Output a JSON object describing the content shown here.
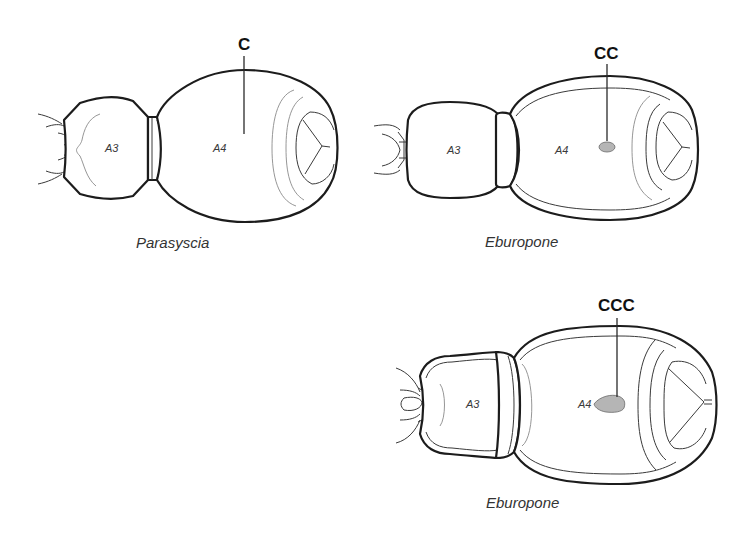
{
  "figures": [
    {
      "id": "parasyscia",
      "caption": "Parasyscia",
      "callout": "C",
      "segment_labels": {
        "a3": "A3",
        "a4": "A4"
      },
      "spot": "none"
    },
    {
      "id": "eburopone-1",
      "caption": "Eburopone",
      "callout": "CC",
      "segment_labels": {
        "a3": "A3",
        "a4": "A4"
      },
      "spot": "small oval",
      "spot_color": "#b5b5b5"
    },
    {
      "id": "eburopone-2",
      "caption": "Eburopone",
      "callout": "CCC",
      "segment_labels": {
        "a3": "A3",
        "a4": "A4"
      },
      "spot": "large teardrop",
      "spot_color": "#b5b5b5"
    }
  ]
}
